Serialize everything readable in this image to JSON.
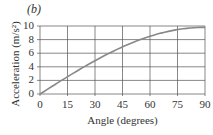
{
  "panel_label": "(b)",
  "chart_data": {
    "type": "line",
    "title": "",
    "xlabel": "Angle (degrees)",
    "ylabel": "Acceleration (m/s²)",
    "xlim": [
      0,
      90
    ],
    "ylim": [
      0,
      10
    ],
    "x_ticks": [
      "0",
      "15",
      "30",
      "45",
      "60",
      "75",
      "90"
    ],
    "y_ticks": [
      "0",
      "2",
      "4",
      "6",
      "8",
      "10"
    ],
    "grid": true,
    "legend": null,
    "series": [
      {
        "name": "a = g sin θ",
        "x": [
          0,
          15,
          30,
          45,
          60,
          75,
          90
        ],
        "values": [
          0,
          2.54,
          4.9,
          6.93,
          8.49,
          9.47,
          9.8
        ]
      }
    ],
    "colors": {
      "line": "#888888",
      "grid": "#555555",
      "axis": "#555555"
    }
  }
}
